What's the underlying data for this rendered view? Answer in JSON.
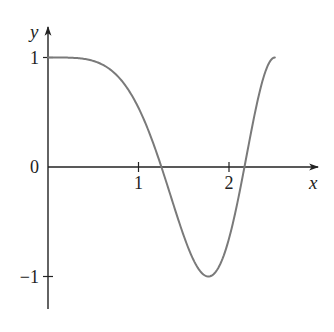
{
  "chart_data": {
    "type": "line",
    "title": "",
    "function": "y = cos(x^2)",
    "xlabel": "x",
    "ylabel": "y",
    "xlim": [
      0,
      2.9
    ],
    "ylim": [
      -1.3,
      1.3
    ],
    "grid": false,
    "legend": null,
    "x_ticks": [
      1,
      2
    ],
    "x_tick_labels": [
      "1",
      "2"
    ],
    "y_ticks": [
      1,
      0,
      -1
    ],
    "y_tick_labels": [
      "1",
      "0",
      "−1"
    ],
    "series": [
      {
        "name": "curve",
        "color": "#7a7a7a",
        "x": [
          0,
          0.25,
          0.5,
          0.75,
          1.0,
          1.1,
          1.2,
          1.2533,
          1.35,
          1.5,
          1.6,
          1.7,
          1.7725,
          1.85,
          1.95,
          2.05,
          2.1708,
          2.25,
          2.35,
          2.45,
          2.5066
        ],
        "y": [
          1.0,
          0.998,
          0.969,
          0.846,
          0.54,
          0.354,
          0.128,
          0.0,
          -0.252,
          -0.628,
          -0.839,
          -0.968,
          -1.0,
          -0.969,
          -0.794,
          -0.474,
          0.0,
          0.35,
          0.7,
          0.945,
          1.0
        ]
      }
    ],
    "axis_color": "#222222"
  },
  "axes": {
    "x_label": "x",
    "y_label": "y",
    "x_tick_labels": [
      "1",
      "2"
    ],
    "y_tick_labels": [
      "1",
      "0",
      "−1"
    ]
  }
}
